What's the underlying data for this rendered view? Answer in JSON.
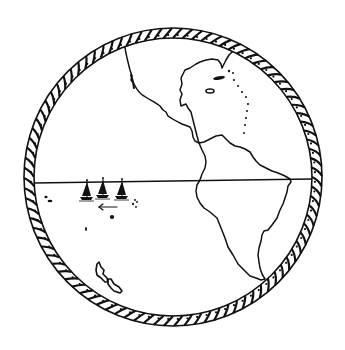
{
  "map": {
    "subject": "Western hemisphere globe",
    "style": "black line-art on white",
    "colors": {
      "ink": "#111111",
      "paper": "#ffffff"
    },
    "globe": {
      "cx": 173,
      "cy": 177,
      "outer_r": 149,
      "inner_r": 139,
      "border": "twisted-rope"
    },
    "equator": {
      "x1": 34,
      "y1": 183,
      "x2": 312,
      "y2": 179
    },
    "features": [
      {
        "name": "north-america",
        "label": ""
      },
      {
        "name": "south-america",
        "label": ""
      },
      {
        "name": "hudson-bay-region",
        "label": ""
      },
      {
        "name": "pacific-islands",
        "label": ""
      }
    ],
    "sailboats": [
      {
        "x": 87,
        "y": 199
      },
      {
        "x": 103,
        "y": 197
      },
      {
        "x": 122,
        "y": 198
      }
    ],
    "direction_arrow": "pointing-west"
  }
}
